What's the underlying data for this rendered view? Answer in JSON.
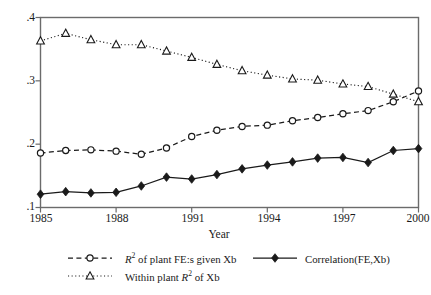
{
  "chart_data": {
    "type": "line",
    "title": "",
    "xlabel": "Year",
    "ylabel": "",
    "x": [
      1985,
      1986,
      1987,
      1988,
      1989,
      1990,
      1991,
      1992,
      1993,
      1994,
      1995,
      1996,
      1997,
      1998,
      1999,
      2000
    ],
    "xlim": [
      1985,
      2000
    ],
    "ylim": [
      0.1,
      0.4
    ],
    "xticks": [
      "1985",
      "1988",
      "1991",
      "1994",
      "1997",
      "2000"
    ],
    "xtick_values": [
      1985,
      1988,
      1991,
      1994,
      1997,
      2000
    ],
    "yticks": [
      ".1",
      ".2",
      ".3",
      ".4"
    ],
    "ytick_values": [
      0.1,
      0.2,
      0.3,
      0.4
    ],
    "grid": false,
    "legend_position": "below",
    "series": [
      {
        "name": "R2 of plant FE:s given Xb",
        "label_html": "<i>R</i><sup>2</sup> of plant FE:s given Xb",
        "marker": "open-circle",
        "linestyle": "dashed",
        "color": "#1a1a1a",
        "values": [
          0.186,
          0.19,
          0.191,
          0.189,
          0.184,
          0.194,
          0.212,
          0.222,
          0.228,
          0.23,
          0.237,
          0.242,
          0.248,
          0.253,
          0.267,
          0.284
        ]
      },
      {
        "name": "Correlation(FE,Xb)",
        "label_html": "Correlation(FE,Xb)",
        "marker": "filled-diamond",
        "linestyle": "solid",
        "color": "#1a1a1a",
        "values": [
          0.121,
          0.125,
          0.123,
          0.124,
          0.134,
          0.148,
          0.145,
          0.152,
          0.161,
          0.167,
          0.172,
          0.178,
          0.179,
          0.171,
          0.19,
          0.193
        ]
      },
      {
        "name": "Within plant R2 of Xb",
        "label_html": "Within plant <i>R</i><sup>2</sup> of Xb",
        "marker": "open-triangle",
        "linestyle": "dotted",
        "color": "#1a1a1a",
        "values": [
          0.363,
          0.375,
          0.365,
          0.357,
          0.357,
          0.347,
          0.337,
          0.326,
          0.316,
          0.309,
          0.303,
          0.301,
          0.295,
          0.291,
          0.279,
          0.267
        ]
      }
    ]
  },
  "axes": {
    "x_title": "Year",
    "y_tick_labels": [
      ".4",
      ".3",
      ".2",
      ".1"
    ],
    "x_tick_labels": [
      "1985",
      "1988",
      "1991",
      "1994",
      "1997",
      "2000"
    ]
  },
  "legend": {
    "entries": [
      {
        "key": "r2-plant-fe",
        "marker": "open-circle",
        "linestyle": "dashed",
        "label_plain": "R2 of plant FE:s given Xb",
        "label_pre_italic": "R",
        "label_sup": "2",
        "label_rest": " of plant FE:s given Xb"
      },
      {
        "key": "correlation-fe-xb",
        "marker": "filled-diamond",
        "linestyle": "solid",
        "label_plain": "Correlation(FE,Xb)",
        "label_pre_italic": "",
        "label_sup": "",
        "label_rest": "Correlation(FE,Xb)"
      },
      {
        "key": "within-plant-r2",
        "marker": "open-triangle",
        "linestyle": "dotted",
        "label_plain": "Within plant R2 of Xb",
        "label_pre_italic": "Within plant ",
        "label_sup": "2",
        "label_rest": " of Xb"
      }
    ]
  },
  "colors": {
    "ink": "#1a1a1a",
    "axis": "#555555",
    "background": "#ffffff"
  }
}
